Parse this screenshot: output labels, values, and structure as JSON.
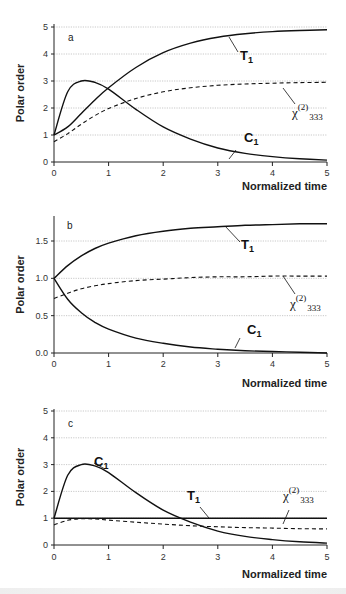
{
  "figure": {
    "y_axis_label": "Polar order",
    "x_axis_label": "Normalized time"
  },
  "chart_data": [
    {
      "type": "line",
      "panel": "a",
      "title": "",
      "xlabel": "Normalized time",
      "ylabel": "Polar order",
      "xlim": [
        0,
        5
      ],
      "ylim": [
        0,
        5
      ],
      "x_ticks": [
        "0",
        "1",
        "2",
        "3",
        "4",
        "5"
      ],
      "y_ticks": [
        "0",
        "1",
        "2",
        "3",
        "4",
        "5"
      ],
      "grid": "horizontal dotted",
      "x": [
        0,
        0.25,
        0.5,
        0.75,
        1,
        1.5,
        2,
        2.5,
        3,
        3.5,
        4,
        4.5,
        5
      ],
      "series": [
        {
          "name": "T1",
          "style": "solid",
          "values": [
            1.0,
            1.3,
            1.8,
            2.3,
            2.75,
            3.5,
            4.05,
            4.4,
            4.62,
            4.75,
            4.83,
            4.87,
            4.9
          ]
        },
        {
          "name": "C1",
          "style": "solid",
          "values": [
            1.0,
            2.6,
            3.0,
            2.95,
            2.7,
            1.95,
            1.3,
            0.85,
            0.52,
            0.32,
            0.2,
            0.12,
            0.07
          ]
        },
        {
          "name": "χ(2)333",
          "style": "dashed",
          "values": [
            0.75,
            1.05,
            1.4,
            1.72,
            1.98,
            2.35,
            2.6,
            2.75,
            2.84,
            2.89,
            2.92,
            2.94,
            2.95
          ]
        }
      ],
      "annotations": [
        "a",
        "T1",
        "C1",
        "χ(2)333"
      ]
    },
    {
      "type": "line",
      "panel": "b",
      "title": "",
      "xlabel": "Normalized time",
      "ylabel": "Polar order",
      "xlim": [
        0,
        5
      ],
      "ylim": [
        0,
        1.8
      ],
      "x_ticks": [
        "0",
        "1",
        "2",
        "3",
        "4",
        "5"
      ],
      "y_ticks": [
        "0.0",
        "0.5",
        "1.0",
        "1.5"
      ],
      "grid": "horizontal dotted",
      "x": [
        0,
        0.25,
        0.5,
        0.75,
        1,
        1.5,
        2,
        2.5,
        3,
        3.5,
        4,
        4.5,
        5
      ],
      "series": [
        {
          "name": "T1",
          "style": "solid",
          "values": [
            1.0,
            1.17,
            1.3,
            1.4,
            1.47,
            1.57,
            1.63,
            1.67,
            1.69,
            1.71,
            1.72,
            1.73,
            1.73
          ]
        },
        {
          "name": "C1",
          "style": "solid",
          "values": [
            1.0,
            0.72,
            0.54,
            0.41,
            0.32,
            0.2,
            0.13,
            0.08,
            0.05,
            0.03,
            0.02,
            0.01,
            0.0
          ]
        },
        {
          "name": "χ(2)333",
          "style": "dashed",
          "values": [
            0.73,
            0.8,
            0.86,
            0.9,
            0.93,
            0.97,
            0.99,
            1.01,
            1.02,
            1.02,
            1.03,
            1.03,
            1.03
          ]
        }
      ],
      "annotations": [
        "b",
        "T1",
        "C1",
        "χ(2)333"
      ]
    },
    {
      "type": "line",
      "panel": "c",
      "title": "",
      "xlabel": "Normalized time",
      "ylabel": "Polar order",
      "xlim": [
        0,
        5
      ],
      "ylim": [
        0,
        5
      ],
      "x_ticks": [
        "0",
        "1",
        "2",
        "3",
        "4",
        "5"
      ],
      "y_ticks": [
        "0",
        "1",
        "2",
        "3",
        "4",
        "5"
      ],
      "grid": "horizontal dotted",
      "x": [
        0,
        0.25,
        0.5,
        0.75,
        1,
        1.5,
        2,
        2.5,
        3,
        3.5,
        4,
        4.5,
        5
      ],
      "series": [
        {
          "name": "T1",
          "style": "solid",
          "values": [
            1,
            1,
            1,
            1,
            1,
            1,
            1,
            1,
            1,
            1,
            1,
            1,
            1
          ]
        },
        {
          "name": "C1",
          "style": "solid",
          "values": [
            1.0,
            2.6,
            3.0,
            2.95,
            2.7,
            1.95,
            1.3,
            0.85,
            0.52,
            0.32,
            0.2,
            0.12,
            0.07
          ]
        },
        {
          "name": "χ(2)333",
          "style": "dashed",
          "values": [
            0.75,
            0.92,
            0.98,
            0.97,
            0.93,
            0.85,
            0.78,
            0.72,
            0.68,
            0.65,
            0.63,
            0.61,
            0.6
          ]
        }
      ],
      "annotations": [
        "c",
        "C1",
        "T1",
        "χ(2)333"
      ]
    }
  ],
  "labels": {
    "a": {
      "panel": "a",
      "T": "T",
      "T_sub": "1",
      "C": "C",
      "C_sub": "1",
      "chi": "χ",
      "chi_sup": "(2)",
      "chi_sub": "333"
    },
    "b": {
      "panel": "b",
      "T": "T",
      "T_sub": "1",
      "C": "C",
      "C_sub": "1",
      "chi": "χ",
      "chi_sup": "(2)",
      "chi_sub": "333"
    },
    "c": {
      "panel": "c",
      "T": "T",
      "T_sub": "1",
      "C": "C",
      "C_sub": "1",
      "chi": "χ",
      "chi_sup": "(2)",
      "chi_sub": "333"
    }
  }
}
